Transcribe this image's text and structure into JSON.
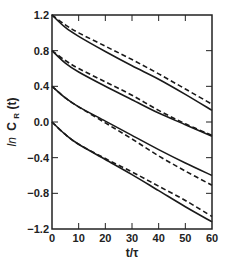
{
  "chart_data": {
    "type": "line",
    "title": "",
    "xlabel": "t/τ",
    "ylabel_prefix": "ln",
    "ylabel_main": "C",
    "ylabel_sub": "R",
    "ylabel_suffix": "(t)",
    "xlim": [
      0,
      60
    ],
    "ylim": [
      -1.2,
      1.2
    ],
    "xticks": [
      0,
      10,
      20,
      30,
      40,
      50,
      60
    ],
    "xtick_labels": [
      "0",
      "10",
      "20",
      "30",
      "40",
      "50",
      "60"
    ],
    "yticks": [
      1.2,
      0.8,
      0.4,
      0.0,
      -0.4,
      -0.8,
      -1.2
    ],
    "ytick_labels": [
      "1.2",
      "0.8",
      "0.4",
      "0.0",
      "−0.4",
      "−0.8",
      "−1.2"
    ],
    "grid": false,
    "legend": null,
    "x": [
      0,
      5,
      10,
      20,
      30,
      40,
      50,
      60
    ],
    "series": [
      {
        "name": "A solid",
        "style": "solid",
        "values": [
          1.2,
          1.06,
          0.96,
          0.79,
          0.63,
          0.48,
          0.31,
          0.13
        ]
      },
      {
        "name": "A dashed",
        "style": "dashed",
        "values": [
          1.2,
          1.09,
          1.0,
          0.85,
          0.7,
          0.54,
          0.37,
          0.2
        ]
      },
      {
        "name": "B solid",
        "style": "solid",
        "values": [
          0.8,
          0.66,
          0.56,
          0.4,
          0.25,
          0.1,
          -0.03,
          -0.16
        ]
      },
      {
        "name": "B dashed",
        "style": "dashed",
        "values": [
          0.8,
          0.69,
          0.6,
          0.45,
          0.3,
          0.13,
          -0.02,
          -0.15
        ]
      },
      {
        "name": "C solid",
        "style": "solid",
        "values": [
          0.4,
          0.27,
          0.17,
          0.01,
          -0.15,
          -0.31,
          -0.46,
          -0.6
        ]
      },
      {
        "name": "C dashed",
        "style": "dashed",
        "values": [
          0.4,
          0.27,
          0.17,
          -0.01,
          -0.19,
          -0.38,
          -0.55,
          -0.71
        ]
      },
      {
        "name": "D solid",
        "style": "solid",
        "values": [
          0.0,
          -0.14,
          -0.25,
          -0.42,
          -0.59,
          -0.77,
          -0.95,
          -1.12
        ]
      },
      {
        "name": "D dashed",
        "style": "dashed",
        "values": [
          0.0,
          -0.14,
          -0.25,
          -0.41,
          -0.56,
          -0.72,
          -0.88,
          -1.06
        ]
      }
    ]
  },
  "colors": {
    "line": "#1a1a1a",
    "axis": "#222222",
    "background": "#ffffff"
  }
}
